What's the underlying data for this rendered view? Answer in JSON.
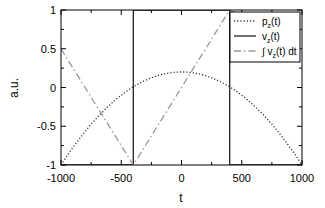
{
  "chart_data": {
    "type": "line",
    "title": "",
    "xlabel": "t",
    "ylabel": "a.u.",
    "xlim": [
      -1000,
      1000
    ],
    "ylim": [
      -1,
      1
    ],
    "xticks": [
      -1000,
      -500,
      0,
      500,
      1000
    ],
    "xtick_labels": [
      "-1000",
      "-500",
      "0",
      "500",
      "1000"
    ],
    "yticks": [
      -1,
      -0.5,
      0,
      0.5,
      1
    ],
    "ytick_labels": [
      "-1",
      "-0.5",
      "0",
      "0.5",
      "1"
    ],
    "grid": false,
    "legend_position": "upper right",
    "series": [
      {
        "name": "p_z(t)",
        "style": "dotted",
        "color": "#000000",
        "x": [
          -1000,
          -800,
          -600,
          -400,
          -200,
          0,
          200,
          400,
          600,
          800,
          1000
        ],
        "y": [
          -1.0,
          -0.57,
          -0.23,
          0.01,
          0.15,
          0.2,
          0.15,
          0.01,
          -0.23,
          -0.57,
          -1.0
        ]
      },
      {
        "name": "v_z(t)",
        "style": "solid",
        "color": "#000000",
        "x": [
          -1000,
          -400,
          -400,
          400,
          400,
          1000
        ],
        "y": [
          -1,
          -1,
          1,
          1,
          -1,
          -1
        ]
      },
      {
        "name": "∫ v_z(t) dt",
        "style": "dashdot",
        "color": "#000000",
        "x": [
          -1000,
          -400,
          400,
          1000
        ],
        "y": [
          0.5,
          -1,
          1,
          0.5
        ]
      }
    ]
  },
  "legend": {
    "items": [
      {
        "label": "p",
        "sub": "z",
        "suffix": "(t)"
      },
      {
        "label": "v",
        "sub": "z",
        "suffix": "(t)"
      },
      {
        "label": "∫ v",
        "sub": "z",
        "suffix": "(t) dt"
      }
    ]
  }
}
